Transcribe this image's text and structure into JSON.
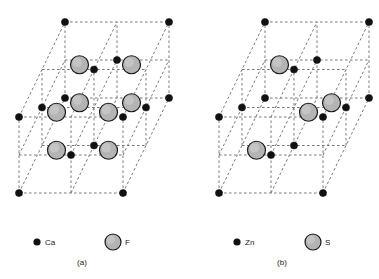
{
  "figure": {
    "title": "",
    "panels": [
      {
        "id": "a",
        "caption": "(a)",
        "structure_name": "fluorite",
        "formula": "CaF2",
        "cation_label": "Ca",
        "anion_label": "F",
        "cation_count_drawn": 14,
        "anion_count_drawn": 8,
        "origin": {
          "x": 19,
          "y": 193
        },
        "axes": {
          "right": {
            "dx": 104,
            "dy": 0
          },
          "up": {
            "dx": 0,
            "dy": -76
          },
          "back": {
            "dx": 46,
            "dy": -95
          }
        },
        "grid_divisions": 2
      },
      {
        "id": "b",
        "caption": "(b)",
        "structure_name": "zinc blende",
        "formula": "ZnS",
        "cation_label": "Zn",
        "anion_label": "S",
        "cation_count_drawn": 14,
        "anion_count_drawn": 4,
        "origin": {
          "x": 219,
          "y": 193
        },
        "axes": {
          "right": {
            "dx": 104,
            "dy": 0
          },
          "up": {
            "dx": 0,
            "dy": -76
          },
          "back": {
            "dx": 46,
            "dy": -95
          }
        },
        "grid_divisions": 2
      }
    ]
  },
  "lattice": {
    "cation_fractional_sites": [
      [
        0,
        0,
        0
      ],
      [
        1,
        0,
        0
      ],
      [
        0,
        1,
        0
      ],
      [
        1,
        1,
        0
      ],
      [
        0,
        0,
        1
      ],
      [
        1,
        0,
        1
      ],
      [
        0,
        1,
        1
      ],
      [
        1,
        1,
        1
      ],
      [
        0.5,
        0.5,
        0
      ],
      [
        0.5,
        0.5,
        1
      ],
      [
        0.5,
        0,
        0.5
      ],
      [
        0.5,
        1,
        0.5
      ],
      [
        0,
        0.5,
        0.5
      ],
      [
        1,
        0.5,
        0.5
      ]
    ],
    "anion_sites_fluorite": [
      [
        0.25,
        0.25,
        0.25
      ],
      [
        0.75,
        0.25,
        0.25
      ],
      [
        0.25,
        0.75,
        0.25
      ],
      [
        0.75,
        0.75,
        0.25
      ],
      [
        0.25,
        0.25,
        0.75
      ],
      [
        0.75,
        0.25,
        0.75
      ],
      [
        0.25,
        0.75,
        0.75
      ],
      [
        0.75,
        0.75,
        0.75
      ]
    ],
    "anion_sites_zincblende": [
      [
        0.25,
        0.25,
        0.25
      ],
      [
        0.75,
        0.75,
        0.25
      ],
      [
        0.75,
        0.25,
        0.75
      ],
      [
        0.25,
        0.75,
        0.75
      ]
    ]
  },
  "legend": {
    "items": [
      {
        "symbol": "Ca",
        "marker": "small-black-dot",
        "panel": "a"
      },
      {
        "symbol": "F",
        "marker": "large-gray-circle",
        "panel": "a"
      },
      {
        "symbol": "Zn",
        "marker": "small-black-dot",
        "panel": "b"
      },
      {
        "symbol": "S",
        "marker": "large-gray-circle",
        "panel": "b"
      }
    ]
  },
  "style": {
    "background": "#ffffff",
    "edge_color": "#7a7a7a",
    "cation_fill": "#111111",
    "anion_fill": "#b4b4b4",
    "anion_stroke": "#1a1a1a",
    "text_color": "#1a1a1a",
    "cation_radius": 3.6,
    "anion_radius": 9.0,
    "legend_dot_radius": 3.6,
    "legend_circle_radius": 8.0
  }
}
